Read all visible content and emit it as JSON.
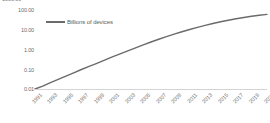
{
  "chart_data": {
    "type": "line",
    "title": "",
    "xlabel": "",
    "ylabel": "",
    "yscale": "log",
    "ylim": [
      0.01,
      100
    ],
    "grid": false,
    "legend_position": "top-left",
    "clipped_top_label": "1000.00",
    "y_ticks": [
      "100.00",
      "10.00",
      "1.00",
      "0.10",
      "0.01"
    ],
    "y_tick_values": [
      100,
      10,
      1,
      0.1,
      0.01
    ],
    "x_ticks": [
      "1991",
      "1993",
      "1995",
      "1997",
      "1999",
      "2001",
      "2003",
      "2005",
      "2007",
      "2009",
      "2011",
      "2013",
      "2015",
      "2017",
      "2019",
      "2021"
    ],
    "series": [
      {
        "name": "Billions of devices",
        "color": "#6b6b6b",
        "x": [
          1991,
          1992,
          1993,
          1994,
          1995,
          1996,
          1997,
          1998,
          1999,
          2000,
          2001,
          2002,
          2003,
          2004,
          2005,
          2006,
          2007,
          2008,
          2009,
          2010,
          2011,
          2012,
          2013,
          2014,
          2015,
          2016,
          2017,
          2018,
          2019,
          2020,
          2021
        ],
        "values": [
          0.01,
          0.014,
          0.021,
          0.031,
          0.045,
          0.066,
          0.097,
          0.14,
          0.2,
          0.29,
          0.42,
          0.6,
          0.85,
          1.2,
          1.7,
          2.4,
          3.3,
          4.5,
          6.0,
          7.9,
          10.3,
          13.2,
          16.7,
          20.8,
          25.4,
          30.5,
          36.0,
          42.0,
          48.0,
          54.0,
          60.0
        ]
      }
    ]
  },
  "legend": {
    "series_label": "Billions of devices"
  }
}
